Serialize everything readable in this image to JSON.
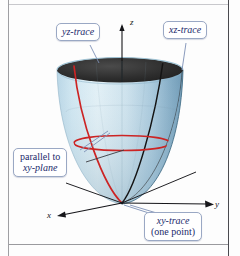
{
  "figure": {
    "surface_type": "elliptic paraboloid",
    "colors": {
      "surface_light": "#cfe3ee",
      "surface_mid": "#a8c9dc",
      "surface_shadow": "#6f95ac",
      "rim_interior": "#2a2a2a",
      "trace_red": "#cc2424",
      "trace_black": "#141414",
      "axis": "#16161a",
      "callout_border": "#9aa8c4",
      "callout_text": "#1b2a6b",
      "leader_line": "#7d90b5",
      "background": "#fdfdfd"
    }
  },
  "axes": {
    "z": {
      "label": "z"
    },
    "x": {
      "label": "x"
    },
    "y": {
      "label": "y"
    }
  },
  "callouts": {
    "yz_trace": {
      "label": "yz-trace"
    },
    "xz_trace": {
      "label": "xz-trace"
    },
    "parallel": {
      "line1": "parallel to",
      "line2": "xy-plane"
    },
    "xy_trace": {
      "line1": "xy-trace",
      "line2": "(one point)"
    }
  }
}
